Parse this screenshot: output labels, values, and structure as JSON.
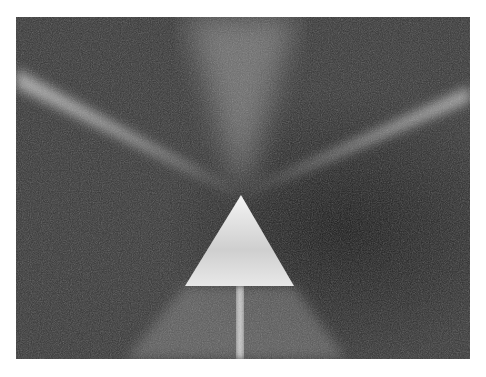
{
  "image": {
    "subject": "Glass prism with beams of light radiating on a textured dark surface",
    "palette": {
      "background": "#2e2e2e",
      "beam": "#d8d8d8",
      "prism": "#e6e6e6",
      "page": "#ffffff"
    }
  }
}
